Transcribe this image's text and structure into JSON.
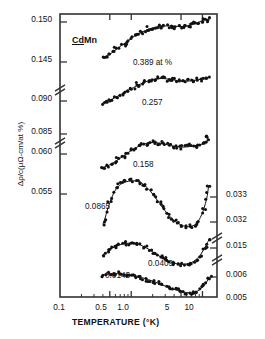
{
  "chart_data": {
    "type": "scatter",
    "title": "",
    "sample_label": "CdMn",
    "sample_underline": "Cd",
    "xlabel": "TEMPERATURE (°K)",
    "ylabel": "Δρ/c(μΩ-cm/at %)",
    "xscale": "log",
    "xlim": [
      0.1,
      16
    ],
    "xticks": [
      0.1,
      0.5,
      1.0,
      5,
      10
    ],
    "xticklabels": [
      "0.1",
      "0.5",
      "1.0",
      "5",
      "10"
    ],
    "grid": false,
    "legend": "inline-annotations",
    "axis_note": "left and right axes are broken into stacked segments, one per series",
    "left_axis_ticks": [
      "0.150",
      "0.145",
      "0.090",
      "0.085",
      "0.060",
      "0.055"
    ],
    "right_axis_ticks": [
      "0.033",
      "0.032",
      "0.015",
      "0.006",
      "0.005"
    ],
    "series": [
      {
        "name": "0.389 at %",
        "annotation": "0.389 at %",
        "axis": "left",
        "ylim": [
          0.1425,
          0.1508
        ],
        "x": [
          0.4,
          0.44,
          0.47,
          0.5,
          0.54,
          0.58,
          0.62,
          0.67,
          0.72,
          0.78,
          0.83,
          0.89,
          0.96,
          1.03,
          1.1,
          1.18,
          1.27,
          1.36,
          1.46,
          1.57,
          1.68,
          1.8,
          1.94,
          2.08,
          2.23,
          2.39,
          2.57,
          2.75,
          2.95,
          3.17,
          3.4,
          3.64,
          3.91,
          4.19,
          4.5,
          4.82,
          5.17,
          5.55,
          5.95,
          6.38,
          6.84,
          7.34,
          7.87,
          8.44,
          9.05,
          9.71,
          10.41,
          11.17,
          11.98,
          12.85
        ],
        "y": [
          0.1433,
          0.1435,
          0.14375,
          0.1439,
          0.1442,
          0.1445,
          0.1448,
          0.1451,
          0.14545,
          0.1457,
          0.146,
          0.1463,
          0.14655,
          0.1469,
          0.14715,
          0.1474,
          0.1476,
          0.1478,
          0.148,
          0.14815,
          0.14835,
          0.1485,
          0.1486,
          0.14872,
          0.1488,
          0.14888,
          0.14893,
          0.14897,
          0.149,
          0.14902,
          0.149,
          0.14898,
          0.14895,
          0.14893,
          0.14892,
          0.1489,
          0.1489,
          0.14893,
          0.14897,
          0.14905,
          0.14915,
          0.14928,
          0.14942,
          0.14958,
          0.14975,
          0.14992,
          0.15005,
          0.15015,
          0.15022,
          0.15028
        ]
      },
      {
        "name": "0.257",
        "annotation": "0.257",
        "axis": "left",
        "ylim": [
          0.0838,
          0.0918
        ],
        "x": [
          0.4,
          0.44,
          0.47,
          0.51,
          0.55,
          0.59,
          0.64,
          0.69,
          0.74,
          0.8,
          0.86,
          0.93,
          1.0,
          1.08,
          1.16,
          1.25,
          1.35,
          1.45,
          1.57,
          1.69,
          1.82,
          1.96,
          2.11,
          2.28,
          2.45,
          2.64,
          2.85,
          3.07,
          3.31,
          3.56,
          3.84,
          4.14,
          4.46,
          4.8,
          5.17,
          5.57,
          6.0,
          6.47,
          6.97,
          7.51,
          8.09,
          8.71,
          9.39,
          10.11,
          10.89,
          11.73
        ],
        "y": [
          0.0844,
          0.0846,
          0.08485,
          0.08505,
          0.0853,
          0.0856,
          0.0859,
          0.0862,
          0.0865,
          0.0868,
          0.0871,
          0.08745,
          0.08775,
          0.08805,
          0.08835,
          0.08865,
          0.0889,
          0.08915,
          0.0894,
          0.0896,
          0.0898,
          0.08995,
          0.09005,
          0.09015,
          0.0902,
          0.09022,
          0.0902,
          0.09015,
          0.09008,
          0.09,
          0.0899,
          0.0898,
          0.08972,
          0.08965,
          0.0896,
          0.08958,
          0.08958,
          0.08962,
          0.08968,
          0.08976,
          0.08985,
          0.08995,
          0.09003,
          0.0901,
          0.09015,
          0.09018
        ]
      },
      {
        "name": "0.158",
        "annotation": "0.158",
        "axis": "left",
        "ylim": [
          0.0543,
          0.0608
        ],
        "x": [
          0.4,
          0.43,
          0.47,
          0.51,
          0.55,
          0.59,
          0.64,
          0.69,
          0.75,
          0.81,
          0.87,
          0.94,
          1.02,
          1.1,
          1.19,
          1.28,
          1.39,
          1.5,
          1.62,
          1.75,
          1.89,
          2.04,
          2.21,
          2.38,
          2.58,
          2.78,
          3.01,
          3.25,
          3.51,
          3.79,
          4.1,
          4.43,
          4.78,
          5.17,
          5.58,
          6.03,
          6.51,
          7.03,
          7.6,
          8.21,
          8.87,
          9.58,
          10.35,
          11.18,
          11.6,
          11.8,
          11.95
        ],
        "y": [
          0.0551,
          0.05525,
          0.05545,
          0.05565,
          0.0559,
          0.05615,
          0.05645,
          0.05675,
          0.05705,
          0.05735,
          0.05765,
          0.05795,
          0.05825,
          0.0585,
          0.05875,
          0.05895,
          0.05915,
          0.0593,
          0.05945,
          0.05955,
          0.0596,
          0.05962,
          0.0596,
          0.05955,
          0.05948,
          0.0594,
          0.0593,
          0.0592,
          0.0591,
          0.059,
          0.05892,
          0.05886,
          0.05882,
          0.0588,
          0.0588,
          0.05883,
          0.05888,
          0.05895,
          0.05903,
          0.05912,
          0.0592,
          0.05928,
          0.05935,
          0.05942,
          0.0599,
          0.0603,
          0.0606
        ]
      },
      {
        "name": "0.0865",
        "annotation": "0.0865",
        "axis": "right",
        "ylim": [
          0.03155,
          0.03375
        ],
        "x": [
          0.4,
          0.43,
          0.46,
          0.5,
          0.54,
          0.58,
          0.63,
          0.68,
          0.73,
          0.79,
          0.85,
          0.92,
          0.99,
          1.07,
          1.16,
          1.25,
          1.35,
          1.46,
          1.58,
          1.71,
          1.85,
          2.0,
          2.16,
          2.34,
          2.53,
          2.74,
          2.96,
          3.2,
          3.47,
          3.75,
          4.06,
          4.4,
          4.76,
          5.15,
          5.58,
          6.04,
          6.54,
          7.08,
          7.67,
          8.3,
          8.99,
          9.73,
          10.54,
          11.41,
          11.9,
          12.2
        ],
        "y": [
          0.0319,
          0.03215,
          0.03245,
          0.03275,
          0.033,
          0.0332,
          0.03335,
          0.03345,
          0.03352,
          0.03357,
          0.0336,
          0.03362,
          0.03363,
          0.03364,
          0.03363,
          0.03361,
          0.03357,
          0.03351,
          0.03343,
          0.03334,
          0.03323,
          0.03311,
          0.03298,
          0.03285,
          0.03272,
          0.03258,
          0.03245,
          0.03233,
          0.03222,
          0.03212,
          0.03203,
          0.03196,
          0.0319,
          0.03185,
          0.03182,
          0.0318,
          0.0318,
          0.03182,
          0.03187,
          0.03195,
          0.03208,
          0.03228,
          0.03255,
          0.0329,
          0.0332,
          0.03345
        ]
      },
      {
        "name": "0.0409",
        "annotation": "0.0409",
        "axis": "right",
        "ylim": [
          0.01428,
          0.01545
        ],
        "x": [
          0.4,
          0.43,
          0.47,
          0.5,
          0.54,
          0.59,
          0.63,
          0.68,
          0.74,
          0.8,
          0.86,
          0.93,
          1.0,
          1.08,
          1.17,
          1.26,
          1.36,
          1.47,
          1.59,
          1.72,
          1.86,
          2.01,
          2.17,
          2.35,
          2.54,
          2.74,
          2.96,
          3.2,
          3.46,
          3.74,
          4.04,
          4.37,
          4.72,
          5.1,
          5.51,
          5.96,
          6.44,
          6.96,
          7.52,
          8.13,
          8.79,
          9.5,
          10.27,
          11.1,
          11.8,
          12.4
        ],
        "y": [
          0.0147,
          0.01478,
          0.01485,
          0.01492,
          0.01498,
          0.01503,
          0.01507,
          0.0151,
          0.01513,
          0.01515,
          0.01516,
          0.01517,
          0.01517,
          0.01516,
          0.01514,
          0.01512,
          0.01509,
          0.01505,
          0.015,
          0.01495,
          0.01489,
          0.01483,
          0.01477,
          0.01471,
          0.01465,
          0.01459,
          0.01454,
          0.01449,
          0.01445,
          0.01442,
          0.01439,
          0.01437,
          0.01436,
          0.01435,
          0.01435,
          0.01436,
          0.01438,
          0.01441,
          0.01446,
          0.01453,
          0.01462,
          0.01474,
          0.01489,
          0.01506,
          0.0152,
          0.01532
        ]
      },
      {
        "name": "0.0143",
        "annotation": "0.0143",
        "axis": "right",
        "ylim": [
          0.00492,
          0.00628
        ],
        "x": [
          0.4,
          0.43,
          0.47,
          0.51,
          0.55,
          0.59,
          0.64,
          0.69,
          0.75,
          0.81,
          0.87,
          0.94,
          1.02,
          1.1,
          1.19,
          1.28,
          1.39,
          1.5,
          1.62,
          1.75,
          1.89,
          2.04,
          2.21,
          2.39,
          2.58,
          2.79,
          3.01,
          3.26,
          3.52,
          3.8,
          4.11,
          4.44,
          4.8,
          5.18,
          5.6,
          6.05,
          6.54,
          7.07,
          7.64,
          8.25,
          8.92,
          9.64,
          10.42,
          11.26,
          11.9,
          12.5
        ],
        "y": [
          0.00585,
          0.00588,
          0.0059,
          0.00591,
          0.00592,
          0.00592,
          0.00592,
          0.00591,
          0.0059,
          0.00589,
          0.00588,
          0.00586,
          0.00584,
          0.00582,
          0.0058,
          0.00577,
          0.00574,
          0.00571,
          0.00568,
          0.00564,
          0.0056,
          0.00556,
          0.00552,
          0.00547,
          0.00543,
          0.00538,
          0.00534,
          0.00529,
          0.00525,
          0.00521,
          0.00517,
          0.00513,
          0.0051,
          0.00507,
          0.00505,
          0.00503,
          0.00502,
          0.00502,
          0.00504,
          0.00508,
          0.00514,
          0.00523,
          0.00535,
          0.0055,
          0.00563,
          0.00575
        ]
      }
    ]
  },
  "annotations": {
    "sample": "CdMn",
    "a0389": "0.389 at %",
    "a0257": "0.257",
    "a0158": "0.158",
    "a00865": "0.0865",
    "a00409": "0.0409",
    "a00143": "0.0143"
  },
  "axes": {
    "xlabel": "TEMPERATURE (°K)",
    "ylabel": "Δρ/c(μΩ-cm/at %)",
    "x0": "0.1",
    "x1": "0.5",
    "x2": "1.0",
    "x3": "5",
    "x4": "10",
    "l0": "0.150",
    "l1": "0.145",
    "l2": "0.090",
    "l3": "0.085",
    "l4": "0.060",
    "l5": "0.055",
    "r0": "0.033",
    "r1": "0.032",
    "r2": "0.015",
    "r3": "0.006",
    "r4": "0.005"
  },
  "colors": {
    "ink": "#111111",
    "frame": "#333333"
  }
}
